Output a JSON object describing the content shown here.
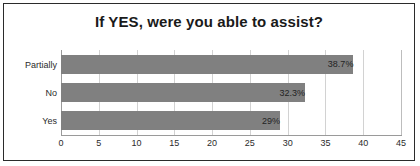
{
  "chart_data": {
    "type": "bar",
    "orientation": "horizontal",
    "title": "If YES, were you able to assist?",
    "xlabel": "",
    "ylabel": "",
    "categories": [
      "Partially",
      "No",
      "Yes"
    ],
    "values": [
      38.7,
      32.3,
      29
    ],
    "value_labels": [
      "38.7%",
      "32.3%",
      "29%"
    ],
    "xlim": [
      0,
      45
    ],
    "xticks": [
      0,
      5,
      10,
      15,
      20,
      25,
      30,
      35,
      40,
      45
    ],
    "xtick_labels": [
      "0",
      "5",
      "10",
      "15",
      "20",
      "25",
      "30",
      "35",
      "40",
      "45"
    ],
    "grid": true,
    "legend": false,
    "bar_color": "#808080",
    "gridline_color": "#d2d2d2",
    "border_color": "#2b2b2b",
    "title_color": "#1a1a1a",
    "label_color": "#2b2b2b"
  }
}
